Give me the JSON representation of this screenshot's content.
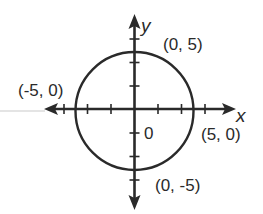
{
  "figure": {
    "type": "circle-on-coordinate-plane",
    "equation_depicted": "circle centered at origin with radius 5",
    "axes": {
      "x_label": "x",
      "y_label": "y",
      "origin_label": "0",
      "tick_interval": 2,
      "x_ticks": [
        -6,
        -4,
        -2,
        2,
        4,
        6
      ],
      "y_ticks": [
        -6,
        -4,
        -2,
        2,
        4,
        6
      ]
    },
    "circle": {
      "center": [
        0,
        0
      ],
      "radius": 5
    },
    "points": [
      {
        "coords": [
          0,
          5
        ],
        "label": "(0, 5)"
      },
      {
        "coords": [
          -5,
          0
        ],
        "label": "(-5, 0)"
      },
      {
        "coords": [
          5,
          0
        ],
        "label": "(5, 0)"
      },
      {
        "coords": [
          0,
          -5
        ],
        "label": "(0, -5)"
      }
    ],
    "colors": {
      "stroke": "#2a2a2a",
      "background": "#ffffff"
    }
  }
}
